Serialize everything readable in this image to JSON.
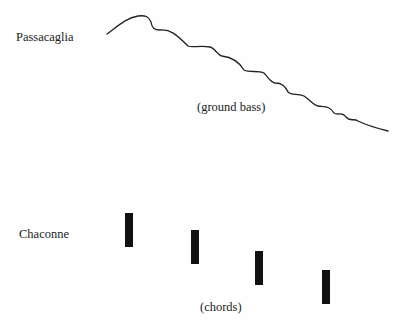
{
  "passacaglia": {
    "label": "Passacaglia",
    "caption": "(ground bass)",
    "curve_description": "descending wavy melodic line"
  },
  "chaconne": {
    "label": "Chaconne",
    "caption": "(chords)",
    "chords": [
      {
        "x": 125,
        "y": 213
      },
      {
        "x": 191,
        "y": 230
      },
      {
        "x": 255,
        "y": 251
      },
      {
        "x": 322,
        "y": 270
      }
    ]
  },
  "colors": {
    "ink": "#111111",
    "background": "#fefefe"
  }
}
